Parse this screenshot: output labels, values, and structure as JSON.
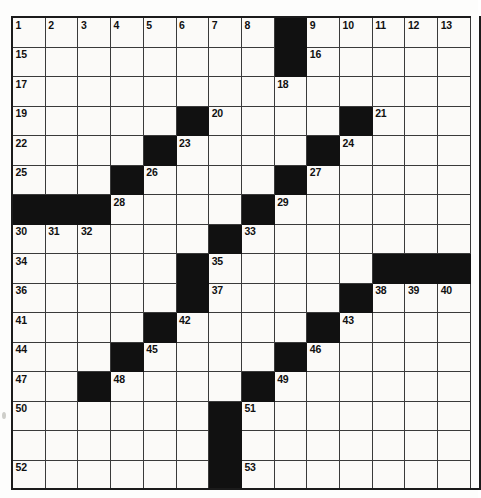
{
  "puzzle": {
    "type": "crossword-grid",
    "columns": 14,
    "rows": 16,
    "background_color": "#fbfaf8",
    "block_color": "#111111",
    "line_color": "#3a3a3a",
    "frame_color": "#1b1b1b",
    "number_color": "#101010",
    "blocked_cells": [
      [
        1,
        9
      ],
      [
        2,
        9
      ],
      [
        4,
        6
      ],
      [
        4,
        11
      ],
      [
        5,
        5
      ],
      [
        5,
        10
      ],
      [
        6,
        4
      ],
      [
        6,
        9
      ],
      [
        7,
        1
      ],
      [
        7,
        2
      ],
      [
        7,
        3
      ],
      [
        7,
        8
      ],
      [
        8,
        7
      ],
      [
        9,
        6
      ],
      [
        9,
        12
      ],
      [
        9,
        13
      ],
      [
        9,
        14
      ],
      [
        10,
        6
      ],
      [
        10,
        11
      ],
      [
        11,
        5
      ],
      [
        11,
        10
      ],
      [
        12,
        4
      ],
      [
        12,
        9
      ],
      [
        13,
        3
      ],
      [
        13,
        8
      ],
      [
        14,
        7
      ],
      [
        15,
        7
      ],
      [
        16,
        7
      ]
    ],
    "numbered_cells": [
      {
        "n": "1",
        "row": 1,
        "col": 1
      },
      {
        "n": "2",
        "row": 1,
        "col": 2
      },
      {
        "n": "3",
        "row": 1,
        "col": 3
      },
      {
        "n": "4",
        "row": 1,
        "col": 4
      },
      {
        "n": "5",
        "row": 1,
        "col": 5
      },
      {
        "n": "6",
        "row": 1,
        "col": 6
      },
      {
        "n": "7",
        "row": 1,
        "col": 7
      },
      {
        "n": "8",
        "row": 1,
        "col": 8
      },
      {
        "n": "9",
        "row": 1,
        "col": 10
      },
      {
        "n": "10",
        "row": 1,
        "col": 11
      },
      {
        "n": "11",
        "row": 1,
        "col": 12
      },
      {
        "n": "12",
        "row": 1,
        "col": 13
      },
      {
        "n": "13",
        "row": 1,
        "col": 14
      },
      {
        "n": "14",
        "row": 1,
        "col": 15
      },
      {
        "n": "15",
        "row": 2,
        "col": 1
      },
      {
        "n": "16",
        "row": 2,
        "col": 10
      },
      {
        "n": "17",
        "row": 3,
        "col": 1
      },
      {
        "n": "18",
        "row": 3,
        "col": 9
      },
      {
        "n": "19",
        "row": 4,
        "col": 1
      },
      {
        "n": "20",
        "row": 4,
        "col": 7
      },
      {
        "n": "21",
        "row": 4,
        "col": 12
      },
      {
        "n": "22",
        "row": 5,
        "col": 1
      },
      {
        "n": "23",
        "row": 5,
        "col": 6
      },
      {
        "n": "24",
        "row": 5,
        "col": 11
      },
      {
        "n": "25",
        "row": 6,
        "col": 1
      },
      {
        "n": "26",
        "row": 6,
        "col": 5
      },
      {
        "n": "27",
        "row": 6,
        "col": 10
      },
      {
        "n": "28",
        "row": 7,
        "col": 4
      },
      {
        "n": "29",
        "row": 7,
        "col": 9
      },
      {
        "n": "30",
        "row": 8,
        "col": 1
      },
      {
        "n": "31",
        "row": 8,
        "col": 2
      },
      {
        "n": "32",
        "row": 8,
        "col": 3
      },
      {
        "n": "33",
        "row": 8,
        "col": 8
      },
      {
        "n": "34",
        "row": 9,
        "col": 1
      },
      {
        "n": "35",
        "row": 9,
        "col": 7
      },
      {
        "n": "36",
        "row": 10,
        "col": 1
      },
      {
        "n": "37",
        "row": 10,
        "col": 7
      },
      {
        "n": "38",
        "row": 10,
        "col": 12
      },
      {
        "n": "39",
        "row": 10,
        "col": 13
      },
      {
        "n": "40",
        "row": 10,
        "col": 14
      },
      {
        "n": "41",
        "row": 11,
        "col": 1
      },
      {
        "n": "42",
        "row": 11,
        "col": 6
      },
      {
        "n": "43",
        "row": 11,
        "col": 11
      },
      {
        "n": "44",
        "row": 12,
        "col": 1
      },
      {
        "n": "45",
        "row": 12,
        "col": 5
      },
      {
        "n": "46",
        "row": 12,
        "col": 10
      },
      {
        "n": "47",
        "row": 13,
        "col": 1
      },
      {
        "n": "48",
        "row": 13,
        "col": 4
      },
      {
        "n": "49",
        "row": 13,
        "col": 9
      },
      {
        "n": "50",
        "row": 14,
        "col": 1
      },
      {
        "n": "51",
        "row": 14,
        "col": 8
      },
      {
        "n": "52",
        "row": 16,
        "col": 1
      },
      {
        "n": "53",
        "row": 16,
        "col": 8
      }
    ],
    "entries": []
  }
}
